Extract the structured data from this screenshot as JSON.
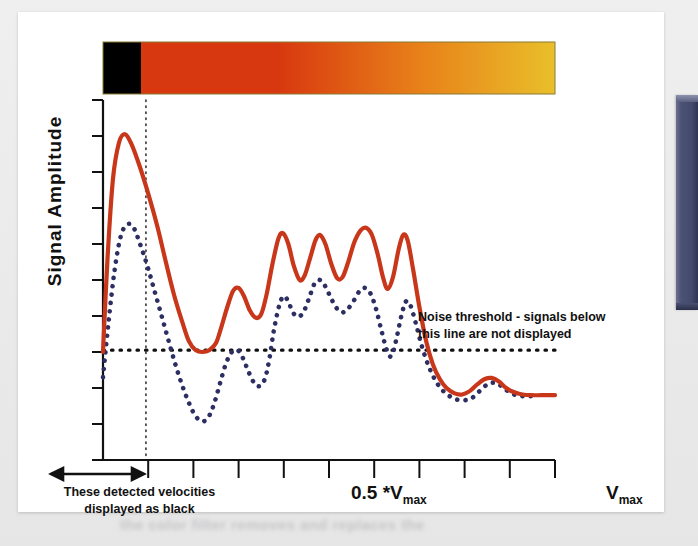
{
  "figure": {
    "y_axis_label": "Signal  Amplitude",
    "annotation_noise": "Noise threshold - signals below this line are not displayed",
    "annotation_noise_line1": "Noise threshold - signals below",
    "annotation_noise_line2": "this line are not displayed",
    "annotation_black_line1": "These detected velocities",
    "annotation_black_line2": "displayed as black",
    "x_tick_label_mid": "0.5 *V",
    "x_tick_label_mid_sub": "max",
    "x_tick_label_max": "V",
    "x_tick_label_max_sub": "max",
    "caption_blurred": "the color filter removes and replaces the"
  },
  "colors": {
    "signal_red": "#c8371a",
    "signal_blue": "#2d2f63",
    "colorbar_black": "#000000",
    "colorbar_red": "#d8380f",
    "colorbar_orange": "#e8821a",
    "colorbar_yellow": "#e9bf2a",
    "axis": "#111111",
    "panel_bg": "#ffffff",
    "page_bg": "#e9e9e9",
    "side_slab": "#4c5273"
  },
  "chart_data": {
    "type": "line",
    "title": "",
    "xlabel": "",
    "ylabel": "Signal  Amplitude",
    "xlim": [
      0,
      1
    ],
    "ylim": [
      0,
      1
    ],
    "grid": false,
    "legend": "none",
    "x_tick_count": 10,
    "y_tick_count": 11,
    "x_ticks_labeled": [
      {
        "x": 0.5,
        "label": "0.5 *Vmax"
      },
      {
        "x": 1.0,
        "label": "Vmax"
      }
    ],
    "annotations": [
      {
        "text": "Noise threshold - signals below this line are not displayed",
        "x": 0.57,
        "y": 0.47
      },
      {
        "text": "These detected velocities displayed as black",
        "x": 0.05,
        "y": -0.12
      }
    ],
    "reference_lines": [
      {
        "name": "noise-threshold",
        "orientation": "horizontal",
        "y": 0.305,
        "style": "dotted",
        "color": "#111111"
      },
      {
        "name": "black-cutoff-velocity",
        "orientation": "vertical",
        "x": 0.095,
        "style": "dotted",
        "color": "#111111"
      }
    ],
    "colorbar": {
      "name": "velocity-color-map",
      "segments": [
        {
          "from": 0.0,
          "to": 0.075,
          "color": "#000000",
          "label": "black (rejected velocities)"
        },
        {
          "from": 0.075,
          "to": 0.4,
          "color": "#d8380f",
          "label": "red"
        },
        {
          "from": 0.4,
          "to": 0.72,
          "color": "#e8821a",
          "label": "orange"
        },
        {
          "from": 0.72,
          "to": 1.0,
          "color": "#e9bf2a",
          "label": "yellow"
        }
      ]
    },
    "series": [
      {
        "name": "signal-with-noise",
        "color": "#c8371a",
        "style": "solid",
        "points": [
          [
            0.0,
            0.3
          ],
          [
            0.01,
            0.56
          ],
          [
            0.022,
            0.78
          ],
          [
            0.035,
            0.88
          ],
          [
            0.048,
            0.905
          ],
          [
            0.062,
            0.88
          ],
          [
            0.08,
            0.82
          ],
          [
            0.1,
            0.74
          ],
          [
            0.12,
            0.65
          ],
          [
            0.14,
            0.545
          ],
          [
            0.158,
            0.455
          ],
          [
            0.175,
            0.385
          ],
          [
            0.19,
            0.33
          ],
          [
            0.205,
            0.305
          ],
          [
            0.22,
            0.3
          ],
          [
            0.235,
            0.305
          ],
          [
            0.25,
            0.325
          ],
          [
            0.262,
            0.37
          ],
          [
            0.275,
            0.425
          ],
          [
            0.288,
            0.47
          ],
          [
            0.3,
            0.478
          ],
          [
            0.312,
            0.455
          ],
          [
            0.325,
            0.415
          ],
          [
            0.338,
            0.395
          ],
          [
            0.35,
            0.405
          ],
          [
            0.362,
            0.46
          ],
          [
            0.375,
            0.545
          ],
          [
            0.388,
            0.615
          ],
          [
            0.398,
            0.63
          ],
          [
            0.41,
            0.6
          ],
          [
            0.422,
            0.54
          ],
          [
            0.435,
            0.5
          ],
          [
            0.446,
            0.512
          ],
          [
            0.458,
            0.56
          ],
          [
            0.47,
            0.61
          ],
          [
            0.48,
            0.625
          ],
          [
            0.492,
            0.6
          ],
          [
            0.505,
            0.545
          ],
          [
            0.518,
            0.505
          ],
          [
            0.53,
            0.508
          ],
          [
            0.542,
            0.548
          ],
          [
            0.556,
            0.605
          ],
          [
            0.57,
            0.638
          ],
          [
            0.582,
            0.645
          ],
          [
            0.595,
            0.625
          ],
          [
            0.608,
            0.57
          ],
          [
            0.62,
            0.505
          ],
          [
            0.63,
            0.475
          ],
          [
            0.642,
            0.51
          ],
          [
            0.654,
            0.585
          ],
          [
            0.664,
            0.625
          ],
          [
            0.674,
            0.61
          ],
          [
            0.686,
            0.53
          ],
          [
            0.7,
            0.425
          ],
          [
            0.715,
            0.33
          ],
          [
            0.73,
            0.265
          ],
          [
            0.745,
            0.225
          ],
          [
            0.76,
            0.2
          ],
          [
            0.778,
            0.185
          ],
          [
            0.795,
            0.182
          ],
          [
            0.812,
            0.192
          ],
          [
            0.828,
            0.21
          ],
          [
            0.845,
            0.225
          ],
          [
            0.86,
            0.228
          ],
          [
            0.876,
            0.218
          ],
          [
            0.892,
            0.2
          ],
          [
            0.91,
            0.188
          ],
          [
            0.928,
            0.182
          ],
          [
            0.948,
            0.18
          ],
          [
            0.97,
            0.18
          ],
          [
            1.0,
            0.18
          ]
        ]
      },
      {
        "name": "signal-noise-filtered",
        "color": "#2d2f63",
        "style": "dotted",
        "points": [
          [
            0.0,
            0.23
          ],
          [
            0.012,
            0.38
          ],
          [
            0.026,
            0.53
          ],
          [
            0.04,
            0.625
          ],
          [
            0.055,
            0.655
          ],
          [
            0.068,
            0.645
          ],
          [
            0.082,
            0.6
          ],
          [
            0.098,
            0.54
          ],
          [
            0.115,
            0.465
          ],
          [
            0.132,
            0.39
          ],
          [
            0.148,
            0.318
          ],
          [
            0.162,
            0.258
          ],
          [
            0.175,
            0.208
          ],
          [
            0.188,
            0.165
          ],
          [
            0.2,
            0.132
          ],
          [
            0.212,
            0.112
          ],
          [
            0.224,
            0.108
          ],
          [
            0.236,
            0.125
          ],
          [
            0.248,
            0.165
          ],
          [
            0.26,
            0.218
          ],
          [
            0.272,
            0.268
          ],
          [
            0.285,
            0.3
          ],
          [
            0.298,
            0.305
          ],
          [
            0.31,
            0.282
          ],
          [
            0.322,
            0.245
          ],
          [
            0.334,
            0.215
          ],
          [
            0.346,
            0.205
          ],
          [
            0.358,
            0.225
          ],
          [
            0.368,
            0.28
          ],
          [
            0.378,
            0.36
          ],
          [
            0.39,
            0.43
          ],
          [
            0.4,
            0.455
          ],
          [
            0.41,
            0.44
          ],
          [
            0.42,
            0.41
          ],
          [
            0.432,
            0.398
          ],
          [
            0.444,
            0.412
          ],
          [
            0.456,
            0.45
          ],
          [
            0.468,
            0.49
          ],
          [
            0.48,
            0.5
          ],
          [
            0.492,
            0.482
          ],
          [
            0.505,
            0.448
          ],
          [
            0.518,
            0.42
          ],
          [
            0.53,
            0.41
          ],
          [
            0.542,
            0.42
          ],
          [
            0.556,
            0.445
          ],
          [
            0.568,
            0.47
          ],
          [
            0.58,
            0.478
          ],
          [
            0.592,
            0.462
          ],
          [
            0.604,
            0.42
          ],
          [
            0.616,
            0.36
          ],
          [
            0.628,
            0.305
          ],
          [
            0.638,
            0.288
          ],
          [
            0.648,
            0.33
          ],
          [
            0.66,
            0.4
          ],
          [
            0.67,
            0.44
          ],
          [
            0.68,
            0.43
          ],
          [
            0.692,
            0.38
          ],
          [
            0.705,
            0.318
          ],
          [
            0.72,
            0.262
          ],
          [
            0.735,
            0.222
          ],
          [
            0.75,
            0.195
          ],
          [
            0.766,
            0.178
          ],
          [
            0.782,
            0.168
          ],
          [
            0.8,
            0.166
          ],
          [
            0.816,
            0.172
          ],
          [
            0.832,
            0.19
          ],
          [
            0.848,
            0.208
          ],
          [
            0.862,
            0.215
          ],
          [
            0.876,
            0.21
          ],
          [
            0.89,
            0.196
          ],
          [
            0.906,
            0.184
          ],
          [
            0.922,
            0.178
          ],
          [
            0.938,
            0.177
          ],
          [
            0.955,
            0.178
          ]
        ]
      }
    ]
  }
}
